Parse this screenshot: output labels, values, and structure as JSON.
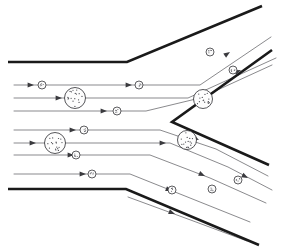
{
  "figure": {
    "width": 281,
    "height": 252,
    "background_color": "#ffffff"
  },
  "colors": {
    "wall": "#1a1a1a",
    "streamline": "#58585c",
    "arrowhead": "#3a3a3e",
    "particle_stroke": "#2a2a2e",
    "particle_fill": "#fdfdfd",
    "speck": "#4a4a50"
  },
  "walls": [
    {
      "name": "upper-wall",
      "label": "Upper duct wall",
      "stroke_width": 2.6,
      "points": "8,62 127,62 262,6"
    },
    {
      "name": "lower-wall",
      "label": "Lower duct wall",
      "stroke_width": 2.6,
      "points": "8,189 126,189 259,245"
    },
    {
      "name": "wedge-divider",
      "label": "Wedge divider",
      "stroke_width": 2.6,
      "points": "272,50 172,122 269,165"
    }
  ],
  "streamlines": [
    {
      "name": "inlet-streamline-1",
      "points": "14,85 200,85 271,37",
      "arrows": [
        {
          "x": 34,
          "y": 85,
          "angle": 0
        },
        {
          "x": 132,
          "y": 85,
          "angle": 0
        },
        {
          "x": 230,
          "y": 52,
          "angle": -34
        }
      ]
    },
    {
      "name": "inlet-streamline-2",
      "points": "14,98 188,98 276,58",
      "arrows": [
        {
          "x": 62,
          "y": 98,
          "angle": 0
        },
        {
          "x": 241,
          "y": 70,
          "angle": -24
        }
      ]
    },
    {
      "name": "inlet-streamline-3",
      "points": "14,111 146,111 200,98 272,65",
      "arrows": [
        {
          "x": 107,
          "y": 111,
          "angle": 0
        }
      ]
    },
    {
      "name": "inlet-streamline-4",
      "points": "14,130 160,130 216,149 268,176",
      "arrows": [
        {
          "x": 76,
          "y": 130,
          "angle": 0
        },
        {
          "x": 199,
          "y": 140,
          "angle": 26
        }
      ]
    },
    {
      "name": "inlet-streamline-5",
      "points": "14,143 170,143 228,167 272,190",
      "arrows": [
        {
          "x": 36,
          "y": 143,
          "angle": 0
        },
        {
          "x": 166,
          "y": 143,
          "angle": 0
        },
        {
          "x": 248,
          "y": 178,
          "angle": 28
        }
      ]
    },
    {
      "name": "inlet-streamline-6",
      "points": "14,155 150,155 210,178 266,203",
      "arrows": [
        {
          "x": 74,
          "y": 155,
          "angle": 0
        },
        {
          "x": 205,
          "y": 176,
          "angle": 24
        }
      ]
    },
    {
      "name": "inlet-streamline-7",
      "points": "14,174 130,174 190,198 250,222",
      "arrows": [
        {
          "x": 86,
          "y": 174,
          "angle": 0
        },
        {
          "x": 172,
          "y": 191,
          "angle": 22
        }
      ]
    },
    {
      "name": "outlet-streamline-lower-1",
      "points": "128,197 196,222 247,241",
      "arrows": [
        {
          "x": 175,
          "y": 214,
          "angle": 21
        }
      ]
    }
  ],
  "particles": [
    {
      "name": "particle-large-1",
      "cx": 75,
      "cy": 98,
      "r": 10.5,
      "size": "large",
      "specks": 17
    },
    {
      "name": "particle-large-2",
      "cx": 55,
      "cy": 143,
      "r": 10.5,
      "size": "large",
      "specks": 17
    },
    {
      "name": "particle-large-3",
      "cx": 203,
      "cy": 99,
      "r": 9.5,
      "size": "large",
      "specks": 15
    },
    {
      "name": "particle-large-4",
      "cx": 187,
      "cy": 140,
      "r": 9.5,
      "size": "large",
      "specks": 15
    },
    {
      "name": "particle-small-1",
      "cx": 42,
      "cy": 85,
      "r": 4.0,
      "size": "small",
      "specks": 5
    },
    {
      "name": "particle-small-2",
      "cx": 139,
      "cy": 85,
      "r": 4.0,
      "size": "small",
      "specks": 5
    },
    {
      "name": "particle-small-3",
      "cx": 117,
      "cy": 111,
      "r": 4.0,
      "size": "small",
      "specks": 5
    },
    {
      "name": "particle-small-4",
      "cx": 210,
      "cy": 52,
      "r": 4.0,
      "size": "small",
      "specks": 5
    },
    {
      "name": "particle-small-5",
      "cx": 233,
      "cy": 70,
      "r": 4.0,
      "size": "small",
      "specks": 5
    },
    {
      "name": "particle-small-6",
      "cx": 84,
      "cy": 130,
      "r": 4.0,
      "size": "small",
      "specks": 5
    },
    {
      "name": "particle-small-7",
      "cx": 76,
      "cy": 155,
      "r": 4.0,
      "size": "small",
      "specks": 5
    },
    {
      "name": "particle-small-8",
      "cx": 92,
      "cy": 174,
      "r": 4.0,
      "size": "small",
      "specks": 5
    },
    {
      "name": "particle-small-9",
      "cx": 238,
      "cy": 180,
      "r": 4.0,
      "size": "small",
      "specks": 5
    },
    {
      "name": "particle-small-10",
      "cx": 212,
      "cy": 189,
      "r": 4.0,
      "size": "small",
      "specks": 5
    },
    {
      "name": "particle-small-11",
      "cx": 172,
      "cy": 190,
      "r": 4.0,
      "size": "small",
      "specks": 5
    }
  ]
}
